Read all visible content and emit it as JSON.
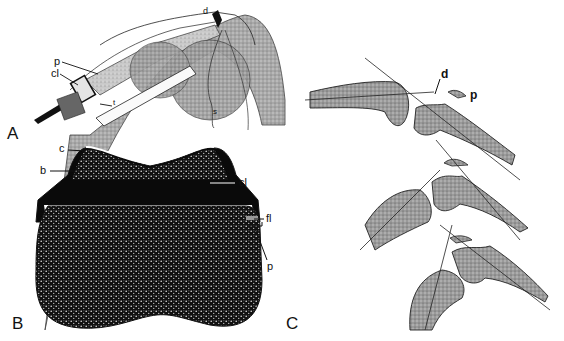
{
  "figure": {
    "panels": [
      {
        "id": "A",
        "letter": "A",
        "description": "Perspective drawing of a flexed joint with an implanted fixation device",
        "labels": {
          "p": "p",
          "cl": "cl",
          "t": "t",
          "d": "d",
          "s": "s"
        }
      },
      {
        "id": "B",
        "letter": "B",
        "description": "Cross-section of bone showing cap, bone and clamp",
        "labels": {
          "c": "c",
          "b": "b",
          "cl": "cl",
          "fl": "fl",
          "p": "p"
        }
      },
      {
        "id": "C",
        "letter": "C",
        "description": "Three sequential outline drawings of joint flexion with axis lines",
        "labels": {
          "d": "d",
          "p": "p"
        }
      }
    ],
    "colors": {
      "ink": "#111111",
      "stipple": "#8a8a8a",
      "light_stipple": "#bdbdbd",
      "background": "#ffffff",
      "dark_fill": "#0a0a0a"
    }
  }
}
